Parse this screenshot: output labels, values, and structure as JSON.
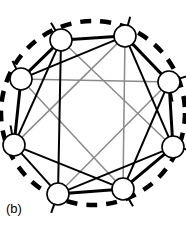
{
  "figure": {
    "panel_label": "(b)",
    "caption_position": "bottom-left",
    "background_color": "#ffffff",
    "width": 186,
    "height": 230
  },
  "chart_data": {
    "type": "diagram",
    "diagram_kind": "node-link-graph",
    "title": "",
    "node_style": {
      "fill": "#ffffff",
      "stroke": "#000000",
      "stroke_width": 1.6,
      "radius": 11
    },
    "nodes": [
      {
        "id": "n0",
        "label": "",
        "x": 61,
        "y": 40
      },
      {
        "id": "n1",
        "label": "",
        "x": 125,
        "y": 36
      },
      {
        "id": "n2",
        "label": "",
        "x": 169,
        "y": 82
      },
      {
        "id": "n3",
        "label": "",
        "x": 173,
        "y": 147
      },
      {
        "id": "n4",
        "label": "",
        "x": 123,
        "y": 189
      },
      {
        "id": "n5",
        "label": "",
        "x": 58,
        "y": 194
      },
      {
        "id": "n6",
        "label": "",
        "x": 14,
        "y": 145
      },
      {
        "id": "n7",
        "label": "",
        "x": 21,
        "y": 79
      }
    ],
    "edge_classes": {
      "thick": {
        "color": "#000000",
        "width": 3.0,
        "dash": "none"
      },
      "medium": {
        "color": "#000000",
        "width": 2.0,
        "dash": "none"
      },
      "gray": {
        "color": "#8a8a8a",
        "width": 1.5,
        "dash": "none"
      }
    },
    "edges": [
      {
        "from": "n0",
        "to": "n1",
        "class": "thick"
      },
      {
        "from": "n1",
        "to": "n2",
        "class": "thick"
      },
      {
        "from": "n2",
        "to": "n3",
        "class": "thick"
      },
      {
        "from": "n3",
        "to": "n4",
        "class": "thick"
      },
      {
        "from": "n4",
        "to": "n5",
        "class": "thick"
      },
      {
        "from": "n5",
        "to": "n6",
        "class": "medium"
      },
      {
        "from": "n6",
        "to": "n7",
        "class": "thick"
      },
      {
        "from": "n7",
        "to": "n0",
        "class": "thick"
      },
      {
        "from": "n7",
        "to": "n1",
        "class": "medium"
      },
      {
        "from": "n0",
        "to": "n5",
        "class": "medium"
      },
      {
        "from": "n1",
        "to": "n3",
        "class": "medium"
      },
      {
        "from": "n2",
        "to": "n4",
        "class": "medium"
      },
      {
        "from": "n4",
        "to": "n6",
        "class": "medium"
      },
      {
        "from": "n5",
        "to": "n3",
        "class": "medium"
      },
      {
        "from": "n6",
        "to": "n0",
        "class": "medium"
      },
      {
        "from": "n0",
        "to": "n3",
        "class": "gray"
      },
      {
        "from": "n1",
        "to": "n4",
        "class": "gray"
      },
      {
        "from": "n2",
        "to": "n5",
        "class": "gray"
      },
      {
        "from": "n6",
        "to": "n1",
        "class": "gray"
      },
      {
        "from": "n7",
        "to": "n4",
        "class": "gray"
      },
      {
        "from": "n7",
        "to": "n2",
        "class": "gray"
      }
    ],
    "stubs": [
      {
        "from": "n0",
        "angle_deg": -120,
        "length": 10,
        "class": "medium"
      },
      {
        "from": "n1",
        "angle_deg": -75,
        "length": 10,
        "class": "medium"
      },
      {
        "from": "n2",
        "angle_deg": -18,
        "length": 10,
        "class": "medium"
      },
      {
        "from": "n2",
        "angle_deg": 80,
        "length": 10,
        "class": "medium"
      },
      {
        "from": "n3",
        "angle_deg": 10,
        "length": 10,
        "class": "medium"
      },
      {
        "from": "n4",
        "angle_deg": 60,
        "length": 10,
        "class": "medium"
      },
      {
        "from": "n5",
        "angle_deg": 110,
        "length": 10,
        "class": "medium"
      },
      {
        "from": "n6",
        "angle_deg": -100,
        "length": 10,
        "class": "medium"
      },
      {
        "from": "n7",
        "angle_deg": -115,
        "length": 10,
        "class": "medium"
      }
    ],
    "boundary": {
      "shape": "circle",
      "center_x": 93,
      "center_y": 113,
      "radius": 92,
      "stroke": "#000000",
      "stroke_width": 4.5,
      "dash_pattern": "11 9"
    }
  }
}
